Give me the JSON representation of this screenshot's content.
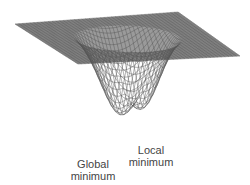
{
  "diagram": {
    "type": "3d-wireframe-surface",
    "line_color": "#555555",
    "plane_color": "#6e6e6e",
    "background": "#ffffff"
  },
  "labels": {
    "global": {
      "line1": "Global",
      "line2": "minimum"
    },
    "local": {
      "line1": "Local",
      "line2": "minimum"
    }
  },
  "surface": {
    "grid_u": 44,
    "grid_v": 44,
    "bowl_radius": 0.62,
    "depth": 1.0,
    "global_min": {
      "x": -0.22,
      "y": 0.18,
      "depth": 1.0
    },
    "local_min": {
      "x": 0.25,
      "y": 0.05,
      "depth": 0.86
    }
  }
}
